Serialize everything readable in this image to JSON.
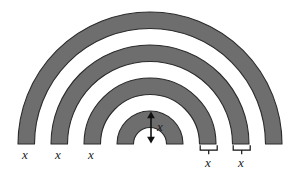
{
  "figure": {
    "kind": "concentric-semicircular-annuli-diagram",
    "colors": {
      "band_fill": "#6e6e6e",
      "band_stroke": "#2b2b2b",
      "gap_fill": "#ffffff",
      "background": "#ffffff",
      "label_color": "#1a1a1a",
      "arrow_color": "#111111",
      "brace_color": "#111111"
    },
    "geometry": {
      "center_x": 150,
      "baseline_y": 144,
      "band_width": 16.5,
      "radii": [
        16.5,
        33,
        49.5,
        66,
        82.5,
        99,
        115.5,
        132
      ],
      "shaded_rings": [
        {
          "inner": 0,
          "outer": 16.5
        },
        {
          "inner": 33,
          "outer": 49.5
        },
        {
          "inner": 66,
          "outer": 82.5
        },
        {
          "inner": 99,
          "outer": 115.5
        }
      ]
    },
    "labels": {
      "left_base": [
        {
          "text": "x",
          "x": 24,
          "y": 152
        },
        {
          "text": "x",
          "x": 57,
          "y": 152
        },
        {
          "text": "x",
          "x": 90,
          "y": 152
        }
      ],
      "center_arrow": {
        "text": "x",
        "x": 159,
        "y": 121,
        "arrow_top_y": 113,
        "arrow_bottom_y": 142,
        "arrow_x": 151
      },
      "right_braces": [
        {
          "text": "x",
          "x": 211,
          "y": 160,
          "brace_left": 200,
          "brace_right": 217,
          "brace_y": 146,
          "tick_x": 208
        },
        {
          "text": "x",
          "x": 244,
          "y": 160,
          "brace_left": 233,
          "brace_right": 250,
          "brace_y": 146,
          "tick_x": 241
        }
      ]
    }
  }
}
